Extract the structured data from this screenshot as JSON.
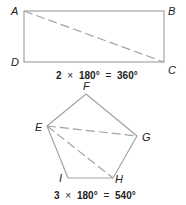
{
  "colors": {
    "line": "#a3a3a3",
    "text": "#222222"
  },
  "rectangle": {
    "vertices": {
      "A": "A",
      "B": "B",
      "C": "C",
      "D": "D"
    },
    "diagonal": "A-C",
    "equation": {
      "count": "2",
      "times": "×",
      "angle": "180°",
      "equals": "=",
      "result": "360°"
    }
  },
  "pentagon": {
    "vertices": {
      "E": "E",
      "F": "F",
      "G": "G",
      "H": "H",
      "I": "I"
    },
    "diagonals": [
      "E-G",
      "E-H"
    ],
    "equation": {
      "count": "3",
      "times": "×",
      "angle": "180°",
      "equals": "=",
      "result": "540°"
    }
  }
}
